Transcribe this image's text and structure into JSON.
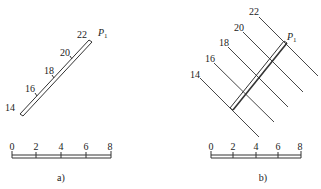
{
  "panel_a": {
    "caption": "a)",
    "plane_label": "P",
    "plane_sub": "1",
    "contours": [
      "14",
      "16",
      "18",
      "20",
      "22"
    ],
    "scale": {
      "ticks": [
        "0",
        "2",
        "4",
        "6",
        "8"
      ]
    }
  },
  "panel_b": {
    "caption": "b)",
    "plane_label": "P",
    "plane_sub": "1",
    "contours": [
      "14",
      "16",
      "18",
      "20",
      "22"
    ],
    "scale": {
      "ticks": [
        "0",
        "2",
        "4",
        "6",
        "8"
      ]
    }
  },
  "colors": {
    "line": "#333333",
    "background": "#ffffff"
  }
}
